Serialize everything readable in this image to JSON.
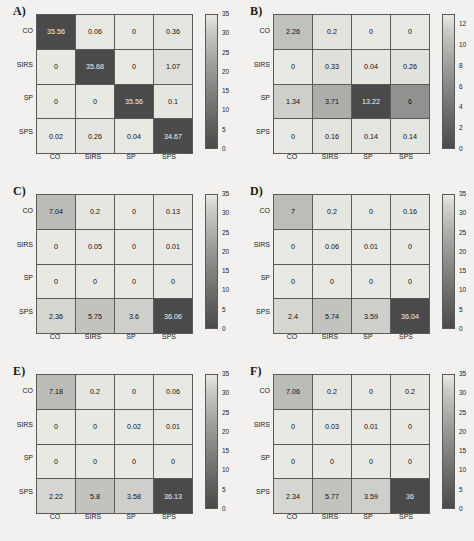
{
  "figure": {
    "background": "#f2f1ef",
    "grid_border_color": "#5a5a5a",
    "colormap_low": "#e9e9e4",
    "colormap_high": "#4a4a4a",
    "class_labels": [
      "CO",
      "SIRS",
      "SP",
      "SPS"
    ]
  },
  "chart_data": [
    {
      "type": "heatmap",
      "title": "A)",
      "xlabel": "",
      "ylabel": "",
      "x_tick_labels": [
        "CO",
        "SIRS",
        "SP",
        "SPS"
      ],
      "y_tick_labels": [
        "CO",
        "SIRS",
        "SP",
        "SPS"
      ],
      "colorbar": {
        "min": 0,
        "max": 35,
        "ticks": [
          0,
          5,
          10,
          15,
          20,
          25,
          30,
          35
        ]
      },
      "values": [
        [
          35.56,
          0.06,
          0,
          0.36
        ],
        [
          0,
          35.68,
          0,
          1.07
        ],
        [
          0,
          0,
          35.56,
          0.1
        ],
        [
          0.02,
          0.26,
          0.04,
          34.67
        ]
      ],
      "cell_text": [
        [
          "35.56",
          "0.06",
          "0",
          "0.36"
        ],
        [
          "0",
          "35.68",
          "0",
          "1.07"
        ],
        [
          "0",
          "0",
          "35.56",
          "0.1"
        ],
        [
          "0.02",
          "0.26",
          "0.04",
          "34.67"
        ]
      ]
    },
    {
      "type": "heatmap",
      "title": "B)",
      "xlabel": "",
      "ylabel": "",
      "x_tick_labels": [
        "CO",
        "SIRS",
        "SP",
        "SPS"
      ],
      "y_tick_labels": [
        "CO",
        "SIRS",
        "SP",
        "SPS"
      ],
      "colorbar": {
        "min": 0,
        "max": 13,
        "ticks": [
          0,
          2,
          4,
          6,
          8,
          10,
          12
        ]
      },
      "values": [
        [
          2.26,
          0.2,
          0,
          0
        ],
        [
          0,
          0.33,
          0.04,
          0.26
        ],
        [
          1.34,
          3.71,
          13.22,
          6
        ],
        [
          0,
          0.16,
          0.14,
          0.14
        ]
      ],
      "cell_text": [
        [
          "2.26",
          "0.2",
          "0",
          "0"
        ],
        [
          "0",
          "0.33",
          "0.04",
          "0.26"
        ],
        [
          "1.34",
          "3.71",
          "13.22",
          "6"
        ],
        [
          "0",
          "0.16",
          "0.14",
          "0.14"
        ]
      ]
    },
    {
      "type": "heatmap",
      "title": "C)",
      "xlabel": "",
      "ylabel": "",
      "x_tick_labels": [
        "CO",
        "SIRS",
        "SP",
        "SPS"
      ],
      "y_tick_labels": [
        "CO",
        "SIRS",
        "SP",
        "SPS"
      ],
      "colorbar": {
        "min": 0,
        "max": 35,
        "ticks": [
          0,
          5,
          10,
          15,
          20,
          25,
          30,
          35
        ]
      },
      "values": [
        [
          7.04,
          0.2,
          0,
          0.13
        ],
        [
          0,
          0.05,
          0,
          0.01
        ],
        [
          0,
          0,
          0,
          0
        ],
        [
          2.36,
          5.75,
          3.6,
          36.06
        ]
      ],
      "cell_text": [
        [
          "7.04",
          "0.2",
          "0",
          "0.13"
        ],
        [
          "0",
          "0.05",
          "0",
          "0.01"
        ],
        [
          "0",
          "0",
          "0",
          "0"
        ],
        [
          "2.36",
          "5.75",
          "3.6",
          "36.06"
        ]
      ]
    },
    {
      "type": "heatmap",
      "title": "D)",
      "xlabel": "",
      "ylabel": "",
      "x_tick_labels": [
        "CO",
        "SIRS",
        "SP",
        "SPS"
      ],
      "y_tick_labels": [
        "CO",
        "SIRS",
        "SP",
        "SPS"
      ],
      "colorbar": {
        "min": 0,
        "max": 35,
        "ticks": [
          0,
          5,
          10,
          15,
          20,
          25,
          30,
          35
        ]
      },
      "values": [
        [
          7,
          0.2,
          0,
          0.16
        ],
        [
          0,
          0.06,
          0.01,
          0
        ],
        [
          0,
          0,
          0,
          0
        ],
        [
          2.4,
          5.74,
          3.59,
          36.04
        ]
      ],
      "cell_text": [
        [
          "7",
          "0.2",
          "0",
          "0.16"
        ],
        [
          "0",
          "0.06",
          "0.01",
          "0"
        ],
        [
          "0",
          "0",
          "0",
          "0"
        ],
        [
          "2.4",
          "5.74",
          "3.59",
          "36.04"
        ]
      ]
    },
    {
      "type": "heatmap",
      "title": "E)",
      "xlabel": "",
      "ylabel": "",
      "x_tick_labels": [
        "CO",
        "SIRS",
        "SP",
        "SPS"
      ],
      "y_tick_labels": [
        "CO",
        "SIRS",
        "SP",
        "SPS"
      ],
      "colorbar": {
        "min": 0,
        "max": 35,
        "ticks": [
          0,
          5,
          10,
          15,
          20,
          25,
          30,
          35
        ]
      },
      "values": [
        [
          7.18,
          0.2,
          0,
          0.06
        ],
        [
          0,
          0,
          0.02,
          0.01
        ],
        [
          0,
          0,
          0,
          0
        ],
        [
          2.22,
          5.8,
          3.58,
          36.13
        ]
      ],
      "cell_text": [
        [
          "7.18",
          "0.2",
          "0",
          "0.06"
        ],
        [
          "0",
          "0",
          "0.02",
          "0.01"
        ],
        [
          "0",
          "0",
          "0",
          "0"
        ],
        [
          "2.22",
          "5.8",
          "3.58",
          "36.13"
        ]
      ]
    },
    {
      "type": "heatmap",
      "title": "F)",
      "xlabel": "",
      "ylabel": "",
      "x_tick_labels": [
        "CO",
        "SIRS",
        "SP",
        "SPS"
      ],
      "y_tick_labels": [
        "CO",
        "SIRS",
        "SP",
        "SPS"
      ],
      "colorbar": {
        "min": 0,
        "max": 35,
        "ticks": [
          0,
          5,
          10,
          15,
          20,
          25,
          30,
          35
        ]
      },
      "values": [
        [
          7.06,
          0.2,
          0,
          0.2
        ],
        [
          0,
          0.03,
          0.01,
          0
        ],
        [
          0,
          0,
          0,
          0
        ],
        [
          2.34,
          5.77,
          3.59,
          36
        ]
      ],
      "cell_text": [
        [
          "7.06",
          "0.2",
          "0",
          "0.2"
        ],
        [
          "0",
          "0.03",
          "0.01",
          "0"
        ],
        [
          "0",
          "0",
          "0",
          "0"
        ],
        [
          "2.34",
          "5.77",
          "3.59",
          "36"
        ]
      ]
    }
  ]
}
